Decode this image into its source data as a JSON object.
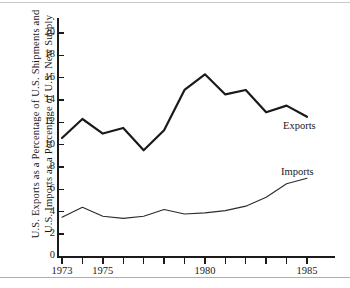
{
  "figure": {
    "top_rule": "rule",
    "bottom_rule": "rule"
  },
  "axis": {
    "y_title_line1": "U.S. Exports as a Percentage of U.S. Shipments and",
    "y_title_line2": "U.S. Imports as a Percentage of U.S. New Supply"
  },
  "series_labels": {
    "exports": "Exports",
    "imports": "Imports"
  },
  "chart_data": {
    "type": "line",
    "title": "",
    "subtitle": "",
    "xlabel": "",
    "ylabel": "U.S. Exports as a Percentage of U.S. Shipments and U.S. Imports as a Percentage of U.S. New Supply",
    "x": [
      1973,
      1974,
      1975,
      1976,
      1977,
      1978,
      1979,
      1980,
      1981,
      1982,
      1983,
      1984,
      1985
    ],
    "xlim": [
      1973,
      1985
    ],
    "ylim": [
      0,
      20
    ],
    "y_ticks": [
      0,
      2,
      4,
      6,
      8,
      10,
      12,
      14,
      16,
      18,
      20
    ],
    "y_tick_labels": [
      "0",
      "2",
      "4",
      "6",
      "8",
      "10",
      "12",
      "14",
      "16",
      "18",
      "20"
    ],
    "x_ticks": [
      1973,
      1974,
      1975,
      1976,
      1977,
      1978,
      1979,
      1980,
      1981,
      1982,
      1983,
      1984,
      1985
    ],
    "x_tick_labels_shown": [
      {
        "value": 1973,
        "label": "1973"
      },
      {
        "value": 1975,
        "label": "1975"
      },
      {
        "value": 1980,
        "label": "1980"
      },
      {
        "value": 1985,
        "label": "1985"
      }
    ],
    "grid": false,
    "legend_position": "inline-right",
    "series": [
      {
        "name": "Exports",
        "color": "#1a1a1a",
        "line_width": 2.2,
        "values": [
          10.6,
          12.3,
          11.0,
          11.5,
          9.5,
          11.3,
          14.9,
          16.3,
          14.5,
          14.9,
          12.9,
          13.5,
          12.5
        ]
      },
      {
        "name": "Imports",
        "color": "#2b2b2b",
        "line_width": 1.1,
        "values": [
          3.5,
          4.4,
          3.6,
          3.4,
          3.6,
          4.2,
          3.8,
          3.9,
          4.1,
          4.5,
          5.3,
          6.5,
          7.0
        ]
      }
    ],
    "annotations": [
      {
        "text": "Exports",
        "x": 1985,
        "y": 12.0
      },
      {
        "text": "Imports",
        "x": 1985,
        "y": 8.0
      }
    ]
  }
}
